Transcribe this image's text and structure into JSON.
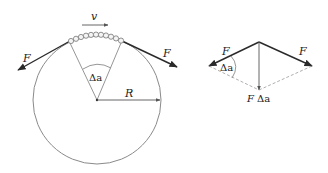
{
  "diagram": {
    "left": {
      "velocity_label": "v",
      "force_left_label": "F",
      "force_right_label": "F",
      "angle_label": "Δa",
      "radius_label": "R",
      "bead_count": 11
    },
    "right": {
      "force_left_label": "F",
      "force_right_label": "F",
      "angle_label": "Δa",
      "resultant_label_f": "F",
      "resultant_label_angle": "Δa"
    },
    "colors": {
      "stroke_dark": "#2a2a2a",
      "stroke_light": "#8a8a8a",
      "dashed": "#9a9a9a",
      "background": "#ffffff"
    }
  }
}
